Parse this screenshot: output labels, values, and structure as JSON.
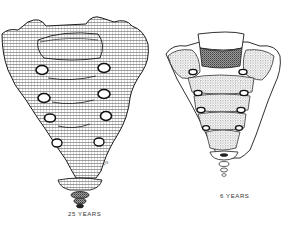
{
  "figure": {
    "panels": [
      {
        "id": "adult",
        "label": "25 YEARS"
      },
      {
        "id": "child",
        "label": "6 YEARS"
      }
    ],
    "artist_signature": "sig.",
    "colors": {
      "ink": "#1a1a1a",
      "background": "#ffffff",
      "shade": "#8a8a8a"
    }
  }
}
